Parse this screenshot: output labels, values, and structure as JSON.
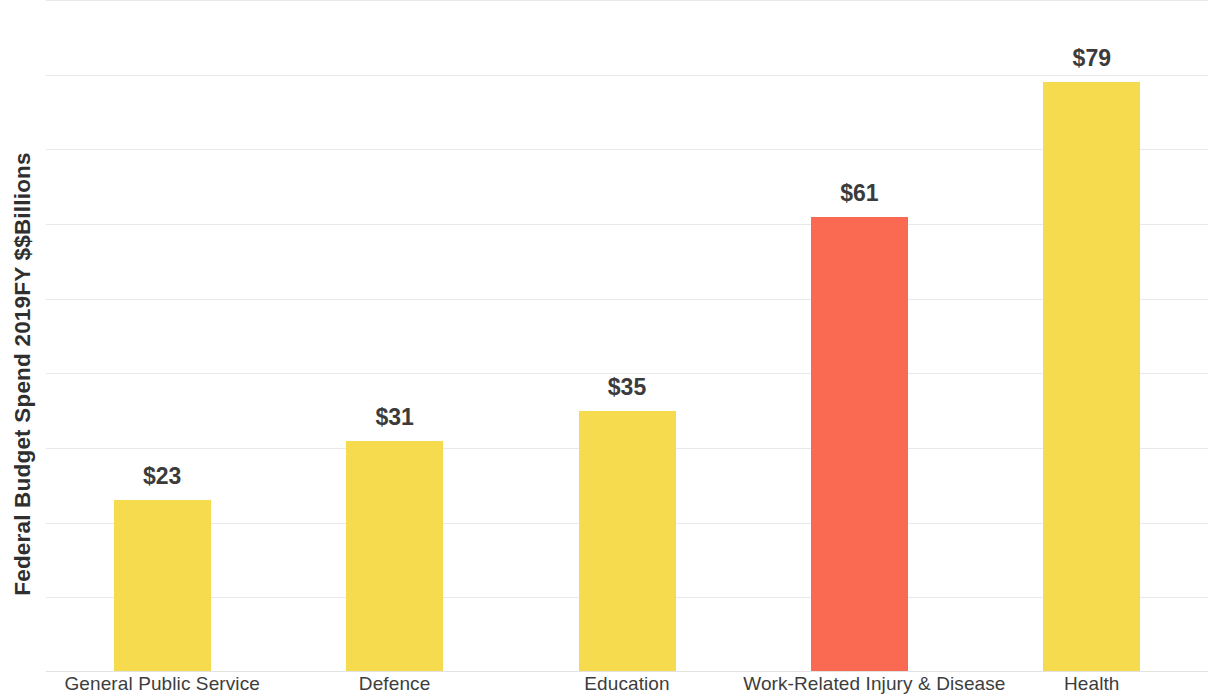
{
  "chart_data": {
    "type": "bar",
    "title": "",
    "xlabel": "",
    "ylabel": "Federal Budget Spend 2019FY $$Billions",
    "categories": [
      "General Public Service",
      "Defence",
      "Education",
      "Work-Related Injury & Disease",
      "Health"
    ],
    "values": [
      23,
      31,
      35,
      61,
      79
    ],
    "value_labels": [
      "$23",
      "$31",
      "$35",
      "$61",
      "$79"
    ],
    "bar_colors": [
      "#f7db4e",
      "#f7db4e",
      "#f7db4e",
      "#fa6a52",
      "#f7db4e"
    ],
    "highlight_category": "Work-Related Injury & Disease",
    "highlight_color": "#fa6a52",
    "base_color": "#f7db4e",
    "ylim": [
      0,
      90
    ],
    "y_tick_interval": 10,
    "y_tick_labels_visible": false,
    "grid": true,
    "gridline_color": "#e9e9ea",
    "legend": "none",
    "label_color": "#3b3b3b"
  },
  "axis": {
    "y_title": "Federal Budget Spend 2019FY $$Billions"
  }
}
